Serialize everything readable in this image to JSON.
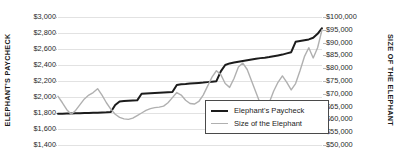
{
  "chart_data": {
    "type": "line",
    "title": "",
    "grid": true,
    "legend_position": "inside-bottom-right",
    "x": [
      0,
      1,
      2,
      3,
      4,
      5,
      6,
      7,
      8,
      9,
      10,
      11,
      12,
      13,
      14,
      15,
      16,
      17,
      18,
      19,
      20,
      21,
      22,
      23,
      24,
      25,
      26,
      27,
      28,
      29,
      30,
      31,
      32,
      33,
      34,
      35,
      36,
      37,
      38,
      39,
      40,
      41,
      42,
      43,
      44,
      45,
      46,
      47,
      48,
      49,
      50,
      51,
      52,
      53,
      54,
      55,
      56,
      57,
      58,
      59,
      60
    ],
    "axes": {
      "left": {
        "label": "ELEPHANT'S PAYCHECK",
        "ticks": [
          "$3,000",
          "$2,800",
          "$2,600",
          "$2,400",
          "$2,200",
          "$2,000",
          "$1,800",
          "$1,600",
          "$1,400"
        ],
        "values": [
          3000,
          2800,
          2600,
          2400,
          2200,
          2000,
          1800,
          1600,
          1400
        ],
        "min": 1400,
        "max": 3000
      },
      "right": {
        "label": "SIZE OF THE ELEPHANT",
        "ticks": [
          "$100,000",
          "$95,000",
          "$90,000",
          "$85,000",
          "$80,000",
          "$75,000",
          "$70,000",
          "$65,000",
          "$60,000",
          "$55,000",
          "$50,000"
        ],
        "values": [
          100000,
          95000,
          90000,
          85000,
          80000,
          75000,
          70000,
          65000,
          60000,
          55000,
          50000
        ],
        "min": 50000,
        "max": 100000
      }
    },
    "series": [
      {
        "name": "Elephant's Paycheck",
        "axis": "left",
        "color": "#1c1c1c",
        "width": 2,
        "values": [
          1790,
          1792,
          1795,
          1795,
          1796,
          1798,
          1800,
          1800,
          1802,
          1804,
          1806,
          1808,
          1812,
          1900,
          1945,
          1950,
          1952,
          1955,
          1958,
          2040,
          2045,
          2048,
          2050,
          2052,
          2055,
          2058,
          2062,
          2150,
          2158,
          2162,
          2168,
          2172,
          2176,
          2180,
          2186,
          2192,
          2198,
          2320,
          2400,
          2420,
          2430,
          2440,
          2450,
          2460,
          2470,
          2478,
          2486,
          2492,
          2500,
          2510,
          2520,
          2530,
          2545,
          2560,
          2690,
          2700,
          2710,
          2720,
          2740,
          2790,
          2860
        ]
      },
      {
        "name": "Size of the Elephant",
        "axis": "right",
        "color": "#b0b0b0",
        "width": 1.4,
        "values": [
          69000,
          66500,
          63800,
          62000,
          63500,
          65800,
          68000,
          69500,
          70500,
          72000,
          69500,
          66500,
          64000,
          62000,
          60800,
          60200,
          60000,
          60500,
          61500,
          62500,
          63500,
          64200,
          64600,
          64800,
          65200,
          66500,
          68500,
          70500,
          69500,
          67500,
          66200,
          66000,
          67000,
          69500,
          73000,
          76500,
          79000,
          77500,
          74000,
          72500,
          76000,
          80500,
          82000,
          79500,
          75000,
          70500,
          66000,
          63000,
          66500,
          71000,
          74500,
          77000,
          74500,
          71500,
          74000,
          79000,
          84500,
          88000,
          84000,
          88000,
          95000
        ]
      }
    ]
  },
  "legend": {
    "items": [
      {
        "label": "Elephant's Paycheck",
        "style": "dark"
      },
      {
        "label": "Size of the Elephant",
        "style": "light"
      }
    ]
  }
}
